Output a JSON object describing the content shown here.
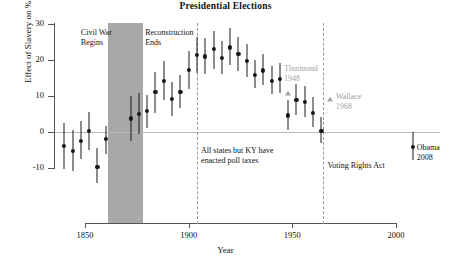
{
  "chart_data": {
    "type": "scatter",
    "title": "Presidential Elections",
    "xlabel": "Year",
    "ylabel": "Effect of Slavery on % Democrat",
    "xlim": [
      1838,
      2012
    ],
    "ylim": [
      -14,
      30
    ],
    "xticks": [
      1850,
      1900,
      1950,
      2000
    ],
    "yticks": [
      -10,
      0,
      10,
      20,
      30
    ],
    "grid": false,
    "legend": "none",
    "series": [
      {
        "name": "Effect of slavery on % Democrat (with 95% CI)",
        "marker": "circle",
        "points": [
          {
            "x": 1840,
            "y": -3.9,
            "lo": -10.4,
            "hi": 2.4
          },
          {
            "x": 1844,
            "y": -5.3,
            "lo": -10.9,
            "hi": 0.6
          },
          {
            "x": 1848,
            "y": -2.4,
            "lo": -7.6,
            "hi": 3.0
          },
          {
            "x": 1852,
            "y": 0.2,
            "lo": -5.0,
            "hi": 5.5
          },
          {
            "x": 1856,
            "y": -9.7,
            "lo": -14.2,
            "hi": -4.4
          },
          {
            "x": 1860,
            "y": -1.9,
            "lo": -6.2,
            "hi": 1.6
          },
          {
            "x": 1872,
            "y": 3.8,
            "lo": -2.6,
            "hi": 10.0
          },
          {
            "x": 1876,
            "y": 5.1,
            "lo": -0.5,
            "hi": 10.8
          },
          {
            "x": 1880,
            "y": 5.8,
            "lo": 1.1,
            "hi": 10.4
          },
          {
            "x": 1884,
            "y": 11.2,
            "lo": 5.4,
            "hi": 16.6
          },
          {
            "x": 1888,
            "y": 14.1,
            "lo": 8.8,
            "hi": 19.6
          },
          {
            "x": 1892,
            "y": 9.1,
            "lo": 4.4,
            "hi": 14.0
          },
          {
            "x": 1896,
            "y": 11.1,
            "lo": 6.7,
            "hi": 15.8
          },
          {
            "x": 1900,
            "y": 17.2,
            "lo": 12.0,
            "hi": 22.4
          },
          {
            "x": 1904,
            "y": 21.5,
            "lo": 16.5,
            "hi": 26.5
          },
          {
            "x": 1908,
            "y": 21.0,
            "lo": 16.0,
            "hi": 26.0
          },
          {
            "x": 1912,
            "y": 23.1,
            "lo": 17.5,
            "hi": 28.0
          },
          {
            "x": 1916,
            "y": 20.5,
            "lo": 16.0,
            "hi": 25.4
          },
          {
            "x": 1920,
            "y": 23.5,
            "lo": 18.5,
            "hi": 28.8
          },
          {
            "x": 1924,
            "y": 21.6,
            "lo": 16.9,
            "hi": 26.5
          },
          {
            "x": 1928,
            "y": 19.7,
            "lo": 15.2,
            "hi": 24.5
          },
          {
            "x": 1932,
            "y": 15.8,
            "lo": 12.2,
            "hi": 20.0
          },
          {
            "x": 1936,
            "y": 17.1,
            "lo": 13.0,
            "hi": 21.6
          },
          {
            "x": 1940,
            "y": 14.2,
            "lo": 10.6,
            "hi": 18.4
          },
          {
            "x": 1944,
            "y": 14.7,
            "lo": 10.7,
            "hi": 19.2
          },
          {
            "x": 1948,
            "y": 4.6,
            "lo": 0.5,
            "hi": 9.0
          },
          {
            "x": 1952,
            "y": 8.9,
            "lo": 4.6,
            "hi": 13.2
          },
          {
            "x": 1956,
            "y": 8.4,
            "lo": 4.3,
            "hi": 12.7
          },
          {
            "x": 1960,
            "y": 5.3,
            "lo": 1.3,
            "hi": 9.6
          },
          {
            "x": 1964,
            "y": 0.3,
            "lo": -3.0,
            "hi": 4.2
          },
          {
            "x": 2008,
            "y": -4.1,
            "lo": -7.9,
            "hi": 0.0
          }
        ]
      },
      {
        "name": "Third-party candidates",
        "marker": "triangle",
        "color": "#a6a6a6",
        "points": [
          {
            "x": 1948,
            "y": 10.8,
            "label": "Thurmond 1948"
          },
          {
            "x": 1968,
            "y": 9.2,
            "label": "Wallace 1968"
          }
        ]
      }
    ],
    "shaded_regions": [
      {
        "label": "Reconstruction",
        "x0": 1861,
        "x1": 1878,
        "color": "#a8a8a8"
      }
    ],
    "vlines": [
      {
        "x": 1904,
        "style": "dashed",
        "color": "#9a9a9a"
      },
      {
        "x": 1965,
        "style": "dashed",
        "color": "#9a9a9a"
      }
    ],
    "annotations": [
      {
        "name": "civil-war-begins",
        "text": "Civil War\nBegins",
        "x": 1848,
        "y": 29
      },
      {
        "name": "reconstruction-ends",
        "text": "Reconstruction\nEnds",
        "x": 1879,
        "y": 29
      },
      {
        "name": "poll-taxes",
        "text": "All states but KY have\nenacted poll taxes",
        "x": 1906,
        "y": -4
      },
      {
        "name": "voting-rights-act",
        "text": "Voting Rights Act",
        "x": 1967,
        "y": -8
      },
      {
        "name": "thurmond",
        "text": "Thurmond\n1948",
        "x": 1946,
        "y": 19,
        "color": "#a2a2a2"
      },
      {
        "name": "wallace",
        "text": "Wallace\n1968",
        "x": 1971,
        "y": 11,
        "color": "#a2a2a2"
      },
      {
        "name": "obama",
        "text": "Obama\n2008",
        "x": 2010,
        "y": -3
      }
    ]
  }
}
